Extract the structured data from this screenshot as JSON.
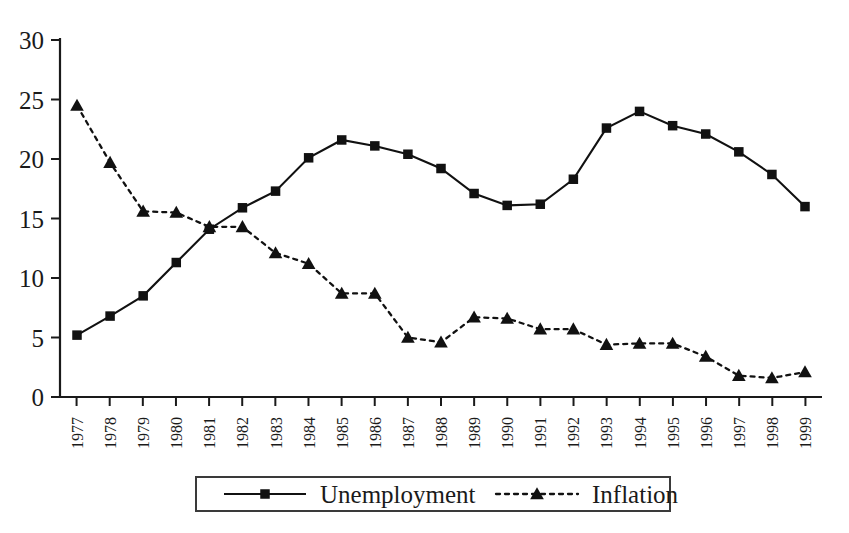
{
  "chart_data": {
    "type": "line",
    "title": "",
    "subtitle": "",
    "xlabel": "",
    "ylabel": "",
    "xlim": [
      1977,
      1999
    ],
    "ylim": [
      0,
      30
    ],
    "grid": false,
    "legend_position": "bottom",
    "categories": [
      "1977",
      "1978",
      "1979",
      "1980",
      "1981",
      "1982",
      "1983",
      "1984",
      "1985",
      "1986",
      "1987",
      "1988",
      "1989",
      "1990",
      "1991",
      "1992",
      "1993",
      "1994",
      "1995",
      "1996",
      "1997",
      "1998",
      "1999"
    ],
    "y_ticks": [
      "0",
      "5",
      "10",
      "15",
      "20",
      "25",
      "30"
    ],
    "y_tick_values": [
      0,
      5,
      10,
      15,
      20,
      25,
      30
    ],
    "series": [
      {
        "name": "Unemployment",
        "marker": "square",
        "line_style": "solid",
        "color": "#111111",
        "values": [
          5.2,
          6.8,
          8.5,
          11.3,
          14.1,
          15.9,
          17.3,
          20.1,
          21.6,
          21.1,
          20.4,
          19.2,
          17.1,
          16.1,
          16.2,
          18.3,
          22.6,
          24.0,
          22.8,
          22.1,
          20.6,
          18.7,
          16.0
        ]
      },
      {
        "name": "Inflation",
        "marker": "triangle",
        "line_style": "dotted",
        "color": "#111111",
        "values": [
          24.5,
          19.7,
          15.6,
          15.5,
          14.3,
          14.3,
          12.1,
          11.2,
          8.7,
          8.7,
          5.0,
          4.6,
          6.7,
          6.6,
          5.7,
          5.7,
          4.4,
          4.5,
          4.5,
          3.4,
          1.8,
          1.6,
          2.1
        ]
      }
    ]
  },
  "legend": {
    "items": [
      {
        "label": "Unemployment",
        "marker": "square",
        "line_style": "solid"
      },
      {
        "label": "Inflation",
        "marker": "triangle",
        "line_style": "dotted"
      }
    ]
  }
}
